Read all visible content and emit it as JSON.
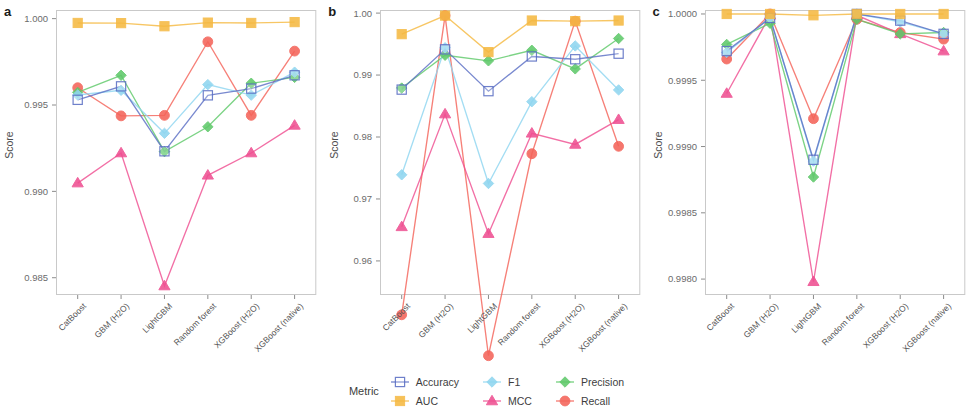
{
  "figure": {
    "ylabel": "Score",
    "panel_letters": [
      "a",
      "b",
      "c"
    ],
    "categories": [
      "CatBoost",
      "GBM (H2O)",
      "LightGBM",
      "Random forest",
      "XGBoost (H2O)",
      "XGBoost (native)"
    ]
  },
  "legend": {
    "title": "Metric",
    "items": [
      {
        "label": "Accuracy",
        "color": "#5b6fc4",
        "marker": "open-square",
        "icon": "accuracy-open-square-icon"
      },
      {
        "label": "F1",
        "color": "#8fd6f0",
        "marker": "diamond",
        "icon": "f1-diamond-icon"
      },
      {
        "label": "Precision",
        "color": "#5fc96a",
        "marker": "diamond",
        "icon": "precision-diamond-icon"
      },
      {
        "label": "AUC",
        "color": "#f5b942",
        "marker": "square",
        "icon": "auc-square-icon"
      },
      {
        "label": "MCC",
        "color": "#ef4f91",
        "marker": "triangle",
        "icon": "mcc-triangle-icon"
      },
      {
        "label": "Recall",
        "color": "#f4645a",
        "marker": "circle",
        "icon": "recall-circle-icon"
      }
    ]
  },
  "chart_data": [
    {
      "type": "line",
      "panel": "a",
      "title": "",
      "xlabel": "",
      "ylabel": "Score",
      "categories": [
        "CatBoost",
        "GBM (H2O)",
        "LightGBM",
        "Random forest",
        "XGBoost (H2O)",
        "XGBoost (native)"
      ],
      "ylim": [
        0.984,
        1.0005
      ],
      "yticks": [
        0.985,
        0.99,
        0.995,
        1.0
      ],
      "ytick_labels": [
        "0.985",
        "0.990",
        "0.995",
        "1.000"
      ],
      "grid": false,
      "legend_position": "bottom",
      "series": [
        {
          "name": "Accuracy",
          "values": [
            0.9953,
            0.99608,
            0.99232,
            0.99556,
            0.99595,
            0.99672
          ]
        },
        {
          "name": "F1",
          "values": [
            0.99558,
            0.99585,
            0.99336,
            0.99618,
            0.99557,
            0.9969
          ]
        },
        {
          "name": "Precision",
          "values": [
            0.99573,
            0.99672,
            0.9923,
            0.99374,
            0.99626,
            0.9966
          ]
        },
        {
          "name": "AUC",
          "values": [
            0.99975,
            0.99974,
            0.99956,
            0.99977,
            0.99975,
            0.9998
          ]
        },
        {
          "name": "MCC",
          "values": [
            0.99048,
            0.99222,
            0.98452,
            0.99093,
            0.99222,
            0.99382
          ]
        },
        {
          "name": "Recall",
          "values": [
            0.996,
            0.99437,
            0.9944,
            0.99866,
            0.9944,
            0.99812
          ]
        }
      ]
    },
    {
      "type": "line",
      "panel": "b",
      "title": "",
      "xlabel": "",
      "ylabel": "Score",
      "categories": [
        "CatBoost",
        "GBM (H2O)",
        "LightGBM",
        "Random forest",
        "XGBoost (H2O)",
        "XGBoost (native)"
      ],
      "ylim": [
        0.9545,
        1.0005
      ],
      "yticks": [
        0.96,
        0.97,
        0.98,
        0.99,
        1.0
      ],
      "ytick_labels": [
        "0.96",
        "0.97",
        "0.98",
        "0.99",
        "1.00"
      ],
      "grid": false,
      "legend_position": "bottom",
      "series": [
        {
          "name": "Accuracy",
          "values": [
            0.98765,
            0.99415,
            0.9874,
            0.993,
            0.99255,
            0.99345
          ]
        },
        {
          "name": "F1",
          "values": [
            0.9739,
            0.9944,
            0.9725,
            0.9857,
            0.9947,
            0.9876
          ]
        },
        {
          "name": "Precision",
          "values": [
            0.9879,
            0.9932,
            0.9923,
            0.994,
            0.991,
            0.9959
          ]
        },
        {
          "name": "AUC",
          "values": [
            0.9966,
            0.9996,
            0.9937,
            0.9988,
            0.9987,
            0.9988
          ]
        },
        {
          "name": "MCC",
          "values": [
            0.9655,
            0.9837,
            0.9644,
            0.9806,
            0.9788,
            0.9828
          ]
        },
        {
          "name": "Recall",
          "values": [
            0.9513,
            0.9996,
            0.9447,
            0.9773,
            0.9987,
            0.9785
          ]
        }
      ]
    },
    {
      "type": "line",
      "panel": "c",
      "title": "",
      "xlabel": "",
      "ylabel": "Score",
      "categories": [
        "CatBoost",
        "GBM (H2O)",
        "LightGBM",
        "Random forest",
        "XGBoost (H2O)",
        "XGBoost (native)"
      ],
      "ylim": [
        0.99788,
        1.00003
      ],
      "yticks": [
        0.998,
        0.9985,
        0.999,
        0.9995,
        1.0
      ],
      "ytick_labels": [
        "0.9980",
        "0.9985",
        "0.9990",
        "0.9995",
        "1.0000"
      ],
      "grid": false,
      "legend_position": "bottom",
      "series": [
        {
          "name": "Accuracy",
          "values": [
            0.99972,
            0.99997,
            0.9989,
            1.0,
            0.99995,
            0.99985
          ]
        },
        {
          "name": "F1",
          "values": [
            0.99971,
            0.99997,
            0.99889,
            1.0,
            0.99994,
            0.99985
          ]
        },
        {
          "name": "Precision",
          "values": [
            0.99977,
            0.99993,
            0.99877,
            0.99996,
            0.99985,
            0.99986
          ]
        },
        {
          "name": "AUC",
          "values": [
            1.0,
            1.0,
            0.99999,
            1.0,
            1.0,
            1.0
          ]
        },
        {
          "name": "MCC",
          "values": [
            0.9994,
            0.99999,
            0.99798,
            0.99999,
            0.99985,
            0.99972
          ]
        },
        {
          "name": "Recall",
          "values": [
            0.99966,
            1.0,
            0.99921,
            0.99996,
            0.99986,
            0.99981
          ]
        }
      ]
    }
  ]
}
